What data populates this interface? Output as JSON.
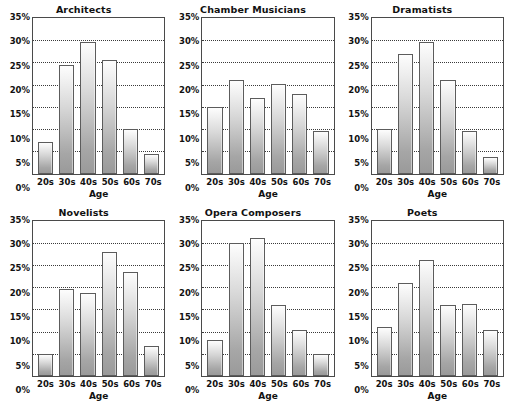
{
  "chart_data": [
    {
      "type": "bar",
      "title": "Architects",
      "categories": [
        "20s",
        "30s",
        "40s",
        "50s",
        "60s",
        "70s"
      ],
      "values": [
        7,
        24.5,
        29.5,
        25.5,
        10,
        4.5
      ],
      "xlabel": "Age",
      "ylabel": "",
      "ylim": [
        0,
        35
      ],
      "yticks": [
        "0%",
        "5%",
        "10%",
        "15%",
        "20%",
        "25%",
        "30%",
        "35%"
      ],
      "ytick_values": [
        0,
        5,
        10,
        15,
        20,
        25,
        30,
        35
      ],
      "grid": true,
      "legend": "none"
    },
    {
      "type": "bar",
      "title": "Chamber Musicians",
      "categories": [
        "20s",
        "30s",
        "40s",
        "50s",
        "60s",
        "70s"
      ],
      "values": [
        15,
        21,
        17,
        20.2,
        18,
        9.5
      ],
      "xlabel": "Age",
      "ylabel": "",
      "ylim": [
        0,
        35
      ],
      "yticks": [
        "0%",
        "5%",
        "10%",
        "15%",
        "20%",
        "25%",
        "30%",
        "35%"
      ],
      "ytick_values": [
        0,
        5,
        10,
        15,
        20,
        25,
        30,
        35
      ],
      "grid": true,
      "legend": "none"
    },
    {
      "type": "bar",
      "title": "Dramatists",
      "categories": [
        "20s",
        "30s",
        "40s",
        "50s",
        "60s",
        "70s"
      ],
      "values": [
        10,
        27,
        29.5,
        21,
        9.5,
        3.8
      ],
      "xlabel": "Age",
      "ylabel": "",
      "ylim": [
        0,
        35
      ],
      "yticks": [
        "0%",
        "5%",
        "10%",
        "15%",
        "20%",
        "25%",
        "30%",
        "35%"
      ],
      "ytick_values": [
        0,
        5,
        10,
        15,
        20,
        25,
        30,
        35
      ],
      "grid": true,
      "legend": "none"
    },
    {
      "type": "bar",
      "title": "Novelists",
      "categories": [
        "20s",
        "30s",
        "40s",
        "50s",
        "60s",
        "70s"
      ],
      "values": [
        5,
        19.5,
        18.7,
        28,
        23.5,
        6.8
      ],
      "xlabel": "Age",
      "ylabel": "",
      "ylim": [
        0,
        35
      ],
      "yticks": [
        "0%",
        "5%",
        "10%",
        "15%",
        "20%",
        "25%",
        "30%",
        "35%"
      ],
      "ytick_values": [
        0,
        5,
        10,
        15,
        20,
        25,
        30,
        35
      ],
      "grid": true,
      "legend": "none"
    },
    {
      "type": "bar",
      "title": "Opera Composers",
      "categories": [
        "20s",
        "30s",
        "40s",
        "50s",
        "60s",
        "70s"
      ],
      "values": [
        8,
        30,
        31,
        16,
        10.3,
        5
      ],
      "xlabel": "Age",
      "ylabel": "",
      "ylim": [
        0,
        35
      ],
      "yticks": [
        "0%",
        "5%",
        "10%",
        "15%",
        "20%",
        "25%",
        "30%",
        "35%"
      ],
      "ytick_values": [
        0,
        5,
        10,
        15,
        20,
        25,
        30,
        35
      ],
      "grid": true,
      "legend": "none"
    },
    {
      "type": "bar",
      "title": "Poets",
      "categories": [
        "20s",
        "30s",
        "40s",
        "50s",
        "60s",
        "70s"
      ],
      "values": [
        11,
        21,
        26.2,
        16,
        16.2,
        10.3
      ],
      "xlabel": "Age",
      "ylabel": "",
      "ylim": [
        0,
        35
      ],
      "yticks": [
        "0%",
        "5%",
        "10%",
        "15%",
        "20%",
        "25%",
        "30%",
        "35%"
      ],
      "ytick_values": [
        0,
        5,
        10,
        15,
        20,
        25,
        30,
        35
      ],
      "grid": true,
      "legend": "none"
    }
  ],
  "style": {
    "bar_outline": "#5c5c5c",
    "bar_fill_top": "#fdfdfd",
    "bar_fill_bottom": "#9a9a9a",
    "gridline_color": "#3a3a3a",
    "axis_color": "#4a4a4a",
    "text_color": "#111111",
    "background": "#ffffff"
  }
}
